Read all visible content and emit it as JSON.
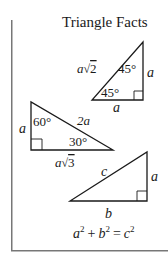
{
  "title": "Triangle Facts",
  "triangles": [
    {
      "name": "45-45-90",
      "hypotenuse": "a√2",
      "hyp_var": "a",
      "hyp_root": "2",
      "top_angle": "45°",
      "bottom_angle": "45°",
      "vertical_side": "a",
      "horizontal_side": "a"
    },
    {
      "name": "30-60-90",
      "hypotenuse": "2a",
      "top_angle": "60°",
      "bottom_angle": "30°",
      "vertical_side": "a",
      "horizontal_side": "a√3",
      "horiz_var": "a",
      "horiz_root": "3"
    },
    {
      "name": "pythagorean",
      "hypotenuse": "c",
      "vertical_side": "a",
      "horizontal_side": "b"
    }
  ],
  "formula": {
    "text": "a² + b² = c²",
    "a": "a",
    "b": "b",
    "c": "c",
    "exp": "2",
    "plus": "+",
    "equals": "="
  },
  "colors": {
    "line": "#1a1a1a",
    "frame": "#777777",
    "background": "#ffffff"
  }
}
